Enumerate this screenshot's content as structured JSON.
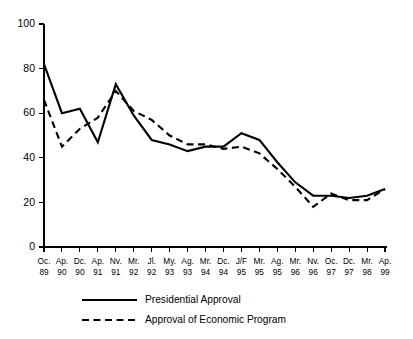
{
  "chart_data": {
    "type": "line",
    "title": "",
    "subtitle": "",
    "xlabel": "",
    "ylabel": "",
    "ylim": [
      0,
      100
    ],
    "yticks": [
      0,
      20,
      40,
      60,
      80,
      100
    ],
    "ytick_labels": [
      "0",
      "20",
      "40",
      "60",
      "80",
      "100"
    ],
    "grid": false,
    "legend_position": "bottom",
    "categories": [
      "Oc. 89",
      "Ap. 90",
      "Dc. 90",
      "Ap. 91",
      "Nv. 91",
      "Mr. 92",
      "Jl. 92",
      "My. 93",
      "Ag. 93",
      "Mr. 94",
      "Dc. 94",
      "J/F 95",
      "Mr. 95",
      "Ag. 95",
      "Mr. 96",
      "Nv. 96",
      "Oc. 97",
      "Dc. 97",
      "Mr. 98",
      "Ap. 99"
    ],
    "category_months": [
      "Oc.",
      "Ap.",
      "Dc.",
      "Ap.",
      "Nv.",
      "Mr.",
      "Jl.",
      "My.",
      "Ag.",
      "Mr.",
      "Dc.",
      "J/F",
      "Mr.",
      "Ag.",
      "Mr.",
      "Nv.",
      "Oc.",
      "Dc.",
      "Mr.",
      "Ap."
    ],
    "category_years": [
      "89",
      "90",
      "90",
      "91",
      "91",
      "92",
      "92",
      "93",
      "93",
      "94",
      "94",
      "95",
      "95",
      "95",
      "96",
      "96",
      "97",
      "97",
      "98",
      "99"
    ],
    "series": [
      {
        "name": "Presidential Approval",
        "style": "solid",
        "color": "#000000",
        "values": [
          82,
          60,
          62,
          47,
          73,
          59,
          48,
          46,
          43,
          45,
          45,
          51,
          48,
          38,
          29,
          23,
          23,
          22,
          23,
          26
        ]
      },
      {
        "name": "Approval of Economic Program",
        "style": "dashed",
        "color": "#000000",
        "values": [
          66,
          45,
          53,
          58,
          70,
          61,
          57,
          50,
          46,
          46,
          44,
          45,
          42,
          35,
          27,
          18,
          24,
          21,
          21,
          26
        ]
      }
    ],
    "legend": [
      {
        "label": "Presidential Approval",
        "style": "solid"
      },
      {
        "label": "Approval of Economic Program",
        "style": "dashed"
      }
    ]
  }
}
